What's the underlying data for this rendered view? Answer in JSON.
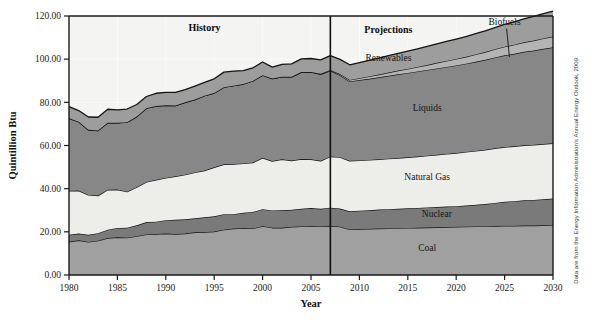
{
  "figure": {
    "credit": "Data are from the Energy Information Administration's Annual Energy Outlook, 2009.",
    "era_history": "History",
    "era_projections": "Projections",
    "divider_year": 2007
  },
  "chart_data": {
    "type": "area",
    "title": "",
    "xlabel": "Year",
    "ylabel": "Quintillion Btu",
    "xlim": [
      1980,
      2030
    ],
    "ylim": [
      0,
      120
    ],
    "ytick_labels": [
      "0.00",
      "20.00",
      "40.00",
      "60.00",
      "80.00",
      "100.00",
      "120.00"
    ],
    "yticks": [
      0,
      20,
      40,
      60,
      80,
      100,
      120
    ],
    "xtick_labels": [
      "1980",
      "1985",
      "1990",
      "1995",
      "2000",
      "2005",
      "2010",
      "2015",
      "2020",
      "2025",
      "2030"
    ],
    "xticks": [
      1980,
      1985,
      1990,
      1995,
      2000,
      2005,
      2010,
      2015,
      2020,
      2025,
      2030
    ],
    "grid": true,
    "stacked": true,
    "legend_position": "inline-labels",
    "annotations": [
      {
        "text": "History",
        "x": 1994,
        "y": 113
      },
      {
        "text": "Projections",
        "x": 2013,
        "y": 112
      },
      {
        "text": "Biofuels",
        "x": 2025,
        "y": 116,
        "leader_to_x": 2025.5,
        "leader_to_y": 101
      }
    ],
    "x": [
      1980,
      1981,
      1982,
      1983,
      1984,
      1985,
      1986,
      1987,
      1988,
      1989,
      1990,
      1991,
      1992,
      1993,
      1994,
      1995,
      1996,
      1997,
      1998,
      1999,
      2000,
      2001,
      2002,
      2003,
      2004,
      2005,
      2006,
      2007,
      2008,
      2009,
      2010,
      2011,
      2012,
      2013,
      2014,
      2015,
      2016,
      2017,
      2018,
      2019,
      2020,
      2021,
      2022,
      2023,
      2024,
      2025,
      2026,
      2027,
      2028,
      2029,
      2030
    ],
    "series": [
      {
        "name": "Coal",
        "color": "#a0a0a0",
        "label_x": 2017,
        "label_y": 11,
        "values": [
          15.4,
          16.1,
          15.3,
          15.9,
          17.1,
          17.5,
          17.3,
          18.0,
          18.8,
          19.0,
          19.2,
          19.0,
          19.2,
          19.8,
          19.9,
          20.1,
          21.0,
          21.5,
          21.7,
          21.6,
          22.6,
          21.9,
          21.9,
          22.3,
          22.5,
          22.8,
          22.5,
          22.8,
          22.4,
          21.1,
          21.3,
          21.4,
          21.5,
          21.6,
          21.7,
          21.8,
          21.9,
          22.0,
          22.1,
          22.2,
          22.3,
          22.4,
          22.5,
          22.6,
          22.7,
          22.8,
          22.8,
          22.9,
          22.9,
          23.0,
          23.1
        ]
      },
      {
        "name": "Nuclear",
        "color": "#7a7a7a",
        "label_x": 2018,
        "label_y": 27,
        "values": [
          3.2,
          3.1,
          3.3,
          3.5,
          3.9,
          4.3,
          4.6,
          5.0,
          5.7,
          5.7,
          6.2,
          6.6,
          6.6,
          6.5,
          6.8,
          7.1,
          7.2,
          6.7,
          7.1,
          7.6,
          7.9,
          8.0,
          8.1,
          7.9,
          8.2,
          8.2,
          8.2,
          8.4,
          8.4,
          8.4,
          8.5,
          8.6,
          8.8,
          8.9,
          9.0,
          9.1,
          9.2,
          9.3,
          9.4,
          9.5,
          9.6,
          9.8,
          10.0,
          10.3,
          10.7,
          11.1,
          11.4,
          11.7,
          11.9,
          12.1,
          12.3
        ]
      },
      {
        "name": "Natural Gas",
        "color": "#ededea",
        "label_x": 2017,
        "label_y": 44,
        "values": [
          20.4,
          19.9,
          18.5,
          17.4,
          18.5,
          17.8,
          16.7,
          17.7,
          18.6,
          19.4,
          19.6,
          20.1,
          20.7,
          21.2,
          21.7,
          22.7,
          23.1,
          23.2,
          22.9,
          22.9,
          23.8,
          22.9,
          23.6,
          22.8,
          23.0,
          22.6,
          22.2,
          23.7,
          23.8,
          23.4,
          23.3,
          23.3,
          23.3,
          23.4,
          23.5,
          23.6,
          23.8,
          24.0,
          24.2,
          24.4,
          24.6,
          24.8,
          25.0,
          25.1,
          25.3,
          25.4,
          25.4,
          25.5,
          25.5,
          25.6,
          25.6
        ]
      },
      {
        "name": "Liquids",
        "color": "#878787",
        "label_x": 2017,
        "label_y": 76,
        "values": [
          33.6,
          31.9,
          30.2,
          30.1,
          31.0,
          30.9,
          32.2,
          32.7,
          34.2,
          34.2,
          33.6,
          32.8,
          33.5,
          33.8,
          34.7,
          34.4,
          35.7,
          36.3,
          36.8,
          37.8,
          38.3,
          38.2,
          38.2,
          38.8,
          40.2,
          40.4,
          40.1,
          39.8,
          38.0,
          36.8,
          37.2,
          37.6,
          38.0,
          38.4,
          38.8,
          39.1,
          39.4,
          39.7,
          40.0,
          40.3,
          40.6,
          40.9,
          41.3,
          41.7,
          42.1,
          42.5,
          42.9,
          43.3,
          43.7,
          44.1,
          44.5
        ]
      },
      {
        "name": "Biofuels",
        "color": "#b4b4b4",
        "label_x": 2025,
        "label_y": 116,
        "values": [
          0.0,
          0.0,
          0.0,
          0.0,
          0.0,
          0.0,
          0.0,
          0.0,
          0.0,
          0.0,
          0.0,
          0.0,
          0.0,
          0.0,
          0.0,
          0.0,
          0.0,
          0.0,
          0.0,
          0.0,
          0.0,
          0.0,
          0.0,
          0.0,
          0.1,
          0.1,
          0.2,
          0.3,
          0.5,
          0.7,
          0.9,
          1.1,
          1.3,
          1.5,
          1.7,
          1.9,
          2.1,
          2.3,
          2.6,
          2.8,
          3.0,
          3.2,
          3.4,
          3.6,
          3.8,
          4.0,
          4.2,
          4.4,
          4.6,
          4.8,
          5.0
        ]
      },
      {
        "name": "Renewables",
        "color": "#9d9d9d",
        "label_x": 2013,
        "label_y": 99,
        "values": [
          5.4,
          5.2,
          5.9,
          6.2,
          6.3,
          6.0,
          6.1,
          5.6,
          5.4,
          5.9,
          6.0,
          6.1,
          5.9,
          6.2,
          6.1,
          6.6,
          7.0,
          6.8,
          6.2,
          6.1,
          6.1,
          5.3,
          5.8,
          6.0,
          6.1,
          6.2,
          6.5,
          6.6,
          6.8,
          7.0,
          7.2,
          7.4,
          7.6,
          7.8,
          8.0,
          8.2,
          8.4,
          8.6,
          8.8,
          9.0,
          9.2,
          9.4,
          9.6,
          9.8,
          10.0,
          10.3,
          10.6,
          10.9,
          11.2,
          11.5,
          11.8
        ]
      }
    ]
  }
}
